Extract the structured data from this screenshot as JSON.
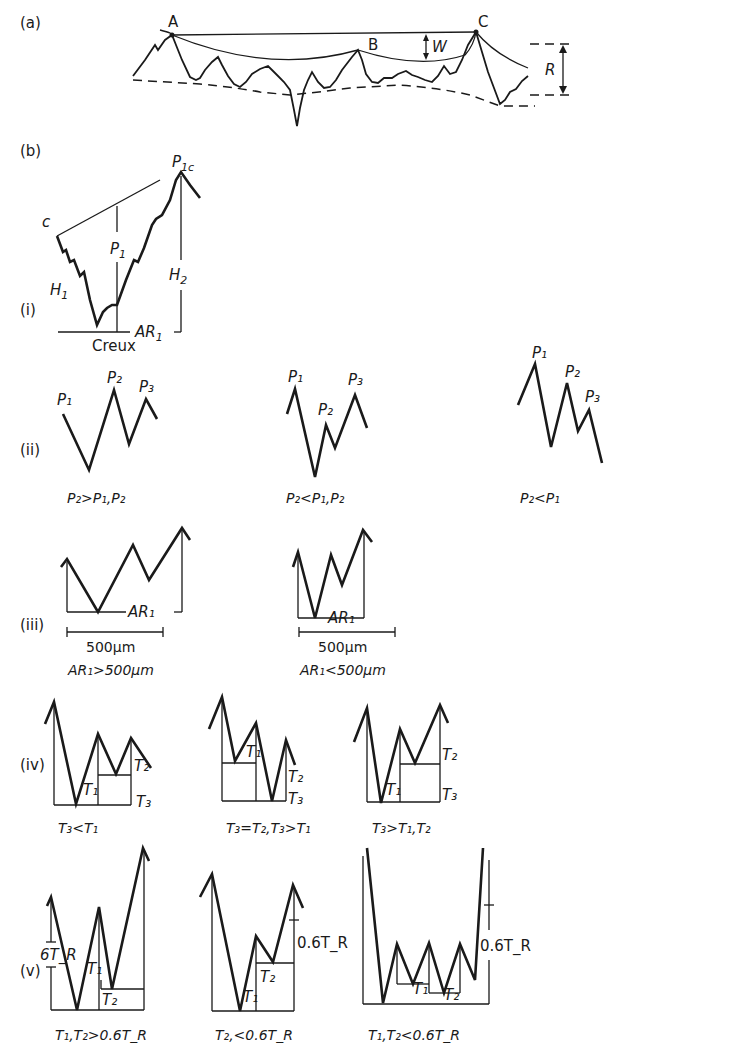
{
  "figure": {
    "panel_a": {
      "label": "(a)",
      "points": [
        "A",
        "B",
        "C"
      ],
      "dims": {
        "w": "W",
        "r": "R"
      }
    },
    "panel_b": {
      "label": "(b)",
      "i": {
        "label": "(i)",
        "c": "c",
        "p1c": "P",
        "p1c_sub": "1c",
        "p1": "P",
        "p1_sub": "1",
        "h1": "H",
        "h1_sub": "1",
        "h2": "H",
        "h2_sub": "2",
        "ar1": "AR",
        "ar1_sub": "1",
        "creux": "Creux"
      },
      "ii": {
        "label": "(ii)",
        "cases": [
          {
            "caption": "P₂>P₁,P₂"
          },
          {
            "caption": "P₂<P₁,P₂"
          },
          {
            "caption": "P₂<P₁"
          }
        ],
        "peak_labels": [
          "P₁",
          "P₂",
          "P₃"
        ]
      },
      "iii": {
        "label": "(iii)",
        "cases": [
          {
            "scale": "500µm",
            "ar": "AR₁",
            "caption": "AR₁>500µm"
          },
          {
            "scale": "500µm",
            "ar": "AR₁",
            "caption": "AR₁<500µm"
          }
        ]
      },
      "iv": {
        "label": "(iv)",
        "cases": [
          {
            "caption": "T₃<T₁",
            "labels": [
              "T₁",
              "T₂",
              "T₃"
            ]
          },
          {
            "caption": "T₃=T₂,T₃>T₁",
            "labels": [
              "T₁",
              "T₂",
              "T₃"
            ]
          },
          {
            "caption": "T₃>T₁,T₂",
            "labels": [
              "T₁",
              "T₂",
              "T₃"
            ]
          }
        ]
      },
      "v": {
        "label": "(v)",
        "cases": [
          {
            "caption": "T₁,T₂>0.6T_R",
            "labels": [
              "6T_R",
              "T₁",
              "T₂"
            ]
          },
          {
            "caption": "T₂,<0.6T_R",
            "labels": [
              "0.6T_R",
              "T₁",
              "T₂"
            ]
          },
          {
            "caption": "T₁,T₂<0.6T_R",
            "labels": [
              "0.6T_R",
              "T₁",
              "T₂"
            ]
          }
        ]
      }
    }
  }
}
